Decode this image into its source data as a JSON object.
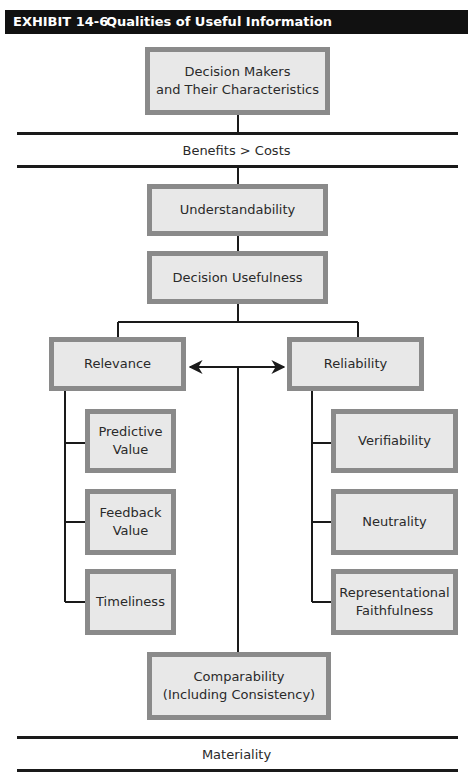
{
  "exhibit": {
    "number": "EXHIBIT 14-6",
    "title": "Qualities of Useful Information"
  },
  "diagram": {
    "top_box": "Decision Makers\nand Their Characteristics",
    "constraint_band": "Benefits > Costs",
    "understandability": "Understandability",
    "decision_usefulness": "Decision Usefulness",
    "relevance": {
      "label": "Relevance",
      "components": [
        "Predictive\nValue",
        "Feedback\nValue",
        "Timeliness"
      ]
    },
    "reliability": {
      "label": "Reliability",
      "components": [
        "Verifiability",
        "Neutrality",
        "Representational\nFaithfulness"
      ]
    },
    "comparability": "Comparability\n(Including Consistency)",
    "threshold_band": "Materiality"
  }
}
